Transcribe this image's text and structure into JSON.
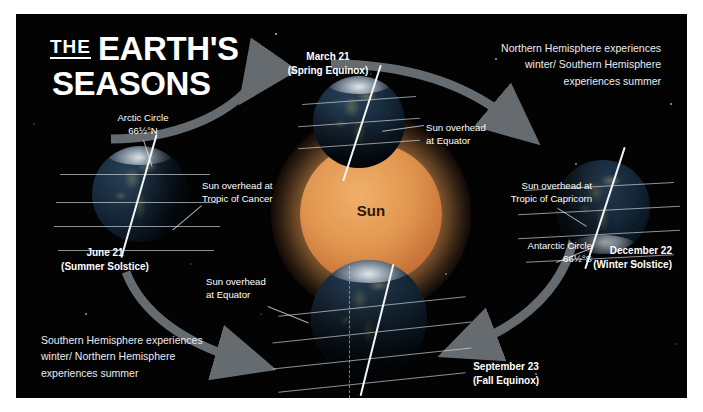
{
  "poster": {
    "title": {
      "the": "THE",
      "line1": "EARTH'S",
      "line2": "SEASONS"
    },
    "background_color": "#030304",
    "accent_color": "#e0954f"
  },
  "notes": {
    "top_right": "Northern Hemisphere experiences winter/ Southern Hemisphere experiences summer",
    "top_right_lines": [
      "Northern Hemisphere experiences",
      "winter/ Southern Hemisphere",
      "experiences summer"
    ],
    "bottom_left": "Southern Hemisphere experiences winter/ Northern Hemisphere experiences summer",
    "bottom_left_lines": [
      "Southern Hemisphere experiences",
      "winter/ Northern Hemisphere",
      "experiences summer"
    ]
  },
  "sun": {
    "label": "Sun"
  },
  "positions": {
    "march": {
      "date": "March 21",
      "event": "(Spring Equinox)"
    },
    "june": {
      "date": "June 21",
      "event": "(Summer Solstice)"
    },
    "september": {
      "date": "September 23",
      "event": "(Fall Equinox)"
    },
    "december": {
      "date": "December 22",
      "event": "(Winter Solstice)"
    }
  },
  "annotations": {
    "arctic_circle": {
      "line1": "Arctic Circle",
      "line2": "66½°N"
    },
    "antarctic_circle": {
      "line1": "Antarctic Circle",
      "line2": "66½°S"
    },
    "sun_tropic_cancer": {
      "line1": "Sun overhead at",
      "line2": "Tropic of Cancer"
    },
    "sun_tropic_capricorn": {
      "line1": "Sun overhead at",
      "line2": "Tropic of Capricorn"
    },
    "sun_equator_top": {
      "line1": "Sun overhead",
      "line2": "at Equator"
    },
    "sun_equator_bottom": {
      "line1": "Sun overhead",
      "line2": "at Equator"
    }
  }
}
